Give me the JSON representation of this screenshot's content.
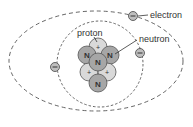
{
  "diagram": {
    "labels": {
      "electron": "electron",
      "proton": "proton",
      "neutron": "neutron"
    },
    "symbols": {
      "neutron": "N",
      "proton": "+",
      "electron": "–"
    },
    "colors": {
      "proton_fill": "#d9d9d9",
      "neutron_fill": "#a6a6a6",
      "stroke": "#555555",
      "orbit": "#555555",
      "electron_fill": "#bfbfbf"
    }
  }
}
